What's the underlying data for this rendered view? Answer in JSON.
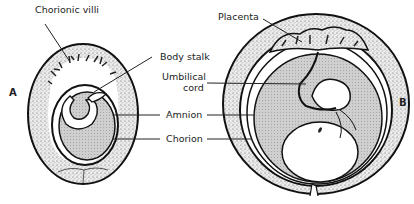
{
  "diagram": {
    "type": "anatomical-illustration",
    "panels": [
      {
        "id": "A",
        "label": "A"
      },
      {
        "id": "B",
        "label": "B"
      }
    ],
    "labels": {
      "chorionic_villi": "Chorionic villi",
      "body_stalk": "Body stalk",
      "umbilical_cord_line1": "Umbilical",
      "umbilical_cord_line2": "cord",
      "amnion": "Amnion",
      "chorion": "Chorion",
      "placenta": "Placenta"
    },
    "colors": {
      "outline": "#111111",
      "stipple_bg": "#e6e6e6",
      "amniotic_fluid": "#c8c8c8",
      "background": "#ffffff"
    }
  }
}
